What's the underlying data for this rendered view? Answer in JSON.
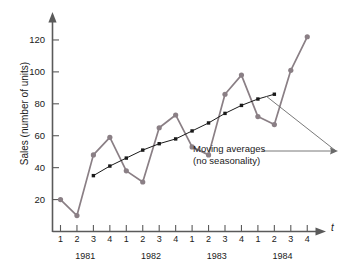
{
  "chart_data": {
    "type": "line",
    "title": "",
    "xlabel": "t",
    "ylabel": "Sales (number of units)",
    "ylim": [
      0,
      130
    ],
    "yticks": [
      20,
      40,
      60,
      80,
      100,
      120
    ],
    "grid": false,
    "legend_position": "none",
    "x_tick_labels": [
      "1",
      "2",
      "3",
      "4",
      "1",
      "2",
      "3",
      "4",
      "1",
      "2",
      "3",
      "4",
      "1",
      "2",
      "3",
      "4"
    ],
    "x_group_labels": [
      "1981",
      "1982",
      "1983",
      "1984"
    ],
    "series": [
      {
        "name": "Sales",
        "marker": "circle",
        "color": "#8a7f85",
        "x": [
          1,
          2,
          3,
          4,
          5,
          6,
          7,
          8,
          9,
          10,
          11,
          12,
          13,
          14,
          15,
          16
        ],
        "values": [
          20,
          10,
          48,
          59,
          38,
          31,
          65,
          73,
          53,
          48,
          86,
          98,
          72,
          67,
          101,
          122
        ]
      },
      {
        "name": "Moving averages (no seasonality)",
        "marker": "square",
        "color": "#1a1a1a",
        "x": [
          3,
          4,
          5,
          6,
          7,
          8,
          9,
          10,
          11,
          12,
          13,
          14
        ],
        "values": [
          35,
          41,
          46,
          51,
          55,
          58,
          63,
          68,
          74,
          79,
          83,
          86
        ]
      }
    ],
    "annotations": [
      {
        "name": "moving-averages-callout",
        "line1": "Moving averages",
        "line2": "(no seasonality)"
      }
    ]
  }
}
